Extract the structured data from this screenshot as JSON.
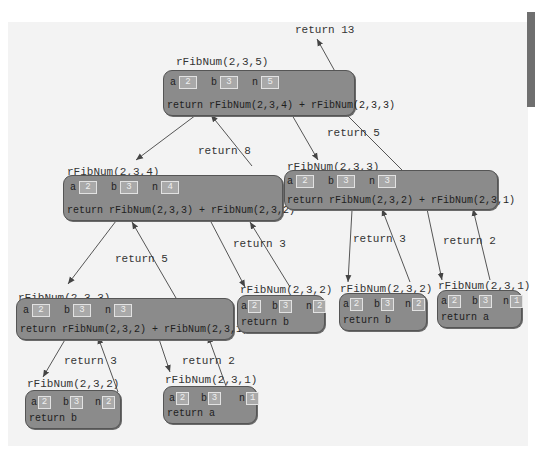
{
  "diagram": {
    "colors": {
      "frame_fill": "#8b8b8b",
      "value_box": "#a9a9a9",
      "background": "#f3f3f3",
      "arrow": "#444444"
    },
    "frames": [
      {
        "id": "f5",
        "call": "rFibNum(2,3,5)",
        "a": "2",
        "b": "3",
        "n": "5",
        "body": "return rFibNum(2,3,4) + rFibNum(2,3,3)"
      },
      {
        "id": "f4",
        "call": "rFibNum(2,3,4)",
        "a": "2",
        "b": "3",
        "n": "4",
        "body": "return rFibNum(2,3,3) + rFibNum(2,3,2)"
      },
      {
        "id": "f3r",
        "call": "rFibNum(2,3,3)",
        "a": "2",
        "b": "3",
        "n": "3",
        "body": "return rFibNum(2,3,2) + rFibNum(2,3,1)"
      },
      {
        "id": "f3l",
        "call": "rFibNum(2,3,3)",
        "a": "2",
        "b": "3",
        "n": "3",
        "body": "return rFibNum(2,3,2) + rFibNum(2,3,1)"
      },
      {
        "id": "f2m",
        "call": "rFibNum(2,3,2)",
        "a": "2",
        "b": "3",
        "n": "2",
        "body": "return b"
      },
      {
        "id": "f2r",
        "call": "rFibNum(2,3,2)",
        "a": "2",
        "b": "3",
        "n": "2",
        "body": "return b"
      },
      {
        "id": "f1r",
        "call": "rFibNum(2,3,1)",
        "a": "2",
        "b": "3",
        "n": "1",
        "body": "return a"
      },
      {
        "id": "f2l",
        "call": "rFibNum(2,3,2)",
        "a": "2",
        "b": "3",
        "n": "2",
        "body": "return b"
      },
      {
        "id": "f1l",
        "call": "rFibNum(2,3,1)",
        "a": "2",
        "b": "3",
        "n": "1",
        "body": "return a"
      }
    ],
    "var_labels": {
      "a": "a",
      "b": "b",
      "n": "n"
    },
    "returns": [
      {
        "id": "r13",
        "label": "return 13"
      },
      {
        "id": "r8",
        "label": "return 8"
      },
      {
        "id": "r5a",
        "label": "return 5"
      },
      {
        "id": "r5b",
        "label": "return 5"
      },
      {
        "id": "r3a",
        "label": "return 3"
      },
      {
        "id": "r3b",
        "label": "return 3"
      },
      {
        "id": "r2a",
        "label": "return 2"
      },
      {
        "id": "r3c",
        "label": "return 3"
      },
      {
        "id": "r2b",
        "label": "return 2"
      }
    ]
  }
}
